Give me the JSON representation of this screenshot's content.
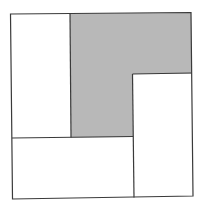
{
  "diagram": {
    "colors": {
      "stroke": "#3a3a3a",
      "shade": "#b8b8b8",
      "background": "#ffffff"
    },
    "outer_square": {
      "x1": 11,
      "y1": 14,
      "x2": 192,
      "y2": 198
    },
    "regions": [
      {
        "name": "left-tall-rectangle",
        "shaded": false
      },
      {
        "name": "shaded-l-region",
        "shaded": true
      },
      {
        "name": "right-tall-rectangle",
        "shaded": false
      },
      {
        "name": "bottom-wide-rectangle",
        "shaded": false
      }
    ]
  }
}
